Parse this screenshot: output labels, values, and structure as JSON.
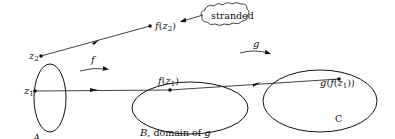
{
  "diagram": {
    "sets": {
      "A": {
        "label": "A"
      },
      "B": {
        "label_italic": "B",
        "label_rest": ", domain of ",
        "label_g": "g"
      },
      "C": {
        "label": "C"
      }
    },
    "points": {
      "z2": {
        "base": "z",
        "sub": "2"
      },
      "z1": {
        "base": "z",
        "sub": "1"
      },
      "f_z2": {
        "pre": "f",
        "open": "(",
        "base": "z",
        "sub": "2",
        "close": ")"
      },
      "f_z1": {
        "pre": "f",
        "open": "(",
        "base": "z",
        "sub": "1",
        "close": ")"
      },
      "g_f_z1": {
        "pre": "g",
        "open": "(",
        "mid": "f",
        "open2": "(",
        "base": "z",
        "sub": "1",
        "close": "))"
      }
    },
    "maps": {
      "f": {
        "label": "f"
      },
      "g": {
        "label": "g"
      }
    },
    "callout": {
      "text": "stranded"
    }
  }
}
